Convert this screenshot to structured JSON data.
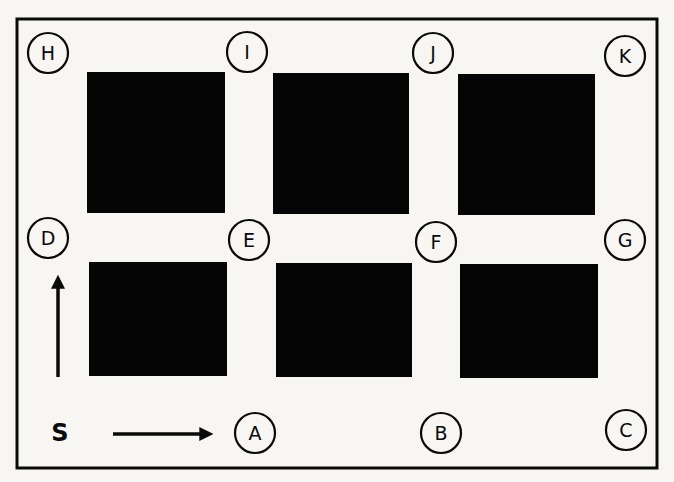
{
  "diagram": {
    "colors": {
      "background": "#f7f6f3",
      "ink": "#0a0a0a",
      "block": "#050505"
    },
    "frame": {
      "x": 17,
      "y": 19,
      "width": 640,
      "height": 449
    },
    "blocks": [
      {
        "id": "block-top-left",
        "x": 87,
        "y": 72,
        "width": 138,
        "height": 141
      },
      {
        "id": "block-top-middle",
        "x": 273,
        "y": 73,
        "width": 136,
        "height": 141
      },
      {
        "id": "block-top-right",
        "x": 458,
        "y": 74,
        "width": 137,
        "height": 141
      },
      {
        "id": "block-bottom-left",
        "x": 89,
        "y": 262,
        "width": 138,
        "height": 114
      },
      {
        "id": "block-bottom-middle",
        "x": 276,
        "y": 263,
        "width": 136,
        "height": 114
      },
      {
        "id": "block-bottom-right",
        "x": 460,
        "y": 264,
        "width": 138,
        "height": 114
      }
    ],
    "nodes": [
      {
        "label": "H",
        "cx": 48,
        "cy": 53
      },
      {
        "label": "I",
        "cx": 247,
        "cy": 52
      },
      {
        "label": "J",
        "cx": 433,
        "cy": 53
      },
      {
        "label": "K",
        "cx": 625,
        "cy": 56
      },
      {
        "label": "D",
        "cx": 48,
        "cy": 238
      },
      {
        "label": "E",
        "cx": 249,
        "cy": 240
      },
      {
        "label": "F",
        "cx": 436,
        "cy": 242
      },
      {
        "label": "G",
        "cx": 625,
        "cy": 240
      },
      {
        "label": "A",
        "cx": 255,
        "cy": 433
      },
      {
        "label": "B",
        "cx": 441,
        "cy": 433
      },
      {
        "label": "C",
        "cx": 626,
        "cy": 430
      }
    ],
    "node_radius": 20,
    "start": {
      "label": "S",
      "x": 60,
      "y": 441
    },
    "arrows": [
      {
        "id": "arrow-east",
        "x1": 113,
        "y1": 434,
        "x2": 207,
        "y2": 434
      },
      {
        "id": "arrow-north",
        "x1": 58,
        "y1": 377,
        "x2": 58,
        "y2": 281
      }
    ]
  }
}
